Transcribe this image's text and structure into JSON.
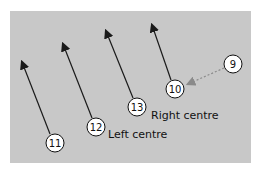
{
  "colors": {
    "field": "#c8c8c8",
    "arrow": "#1a1a1a",
    "pass_arrow": "#8a8a8a",
    "circle_fill": "#ffffff"
  },
  "players": [
    {
      "number": "9",
      "x": 233,
      "y": 64
    },
    {
      "number": "10",
      "x": 175,
      "y": 89
    },
    {
      "number": "11",
      "x": 55,
      "y": 143
    },
    {
      "number": "12",
      "x": 96,
      "y": 127
    },
    {
      "number": "13",
      "x": 137,
      "y": 107
    }
  ],
  "labels": {
    "left_centre": "Left centre",
    "right_centre": "Right centre"
  },
  "runs": [
    {
      "from": "11",
      "to_x": 22,
      "to_y": 60
    },
    {
      "from": "12",
      "to_x": 63,
      "to_y": 42
    },
    {
      "from": "13",
      "to_x": 106,
      "to_y": 29
    },
    {
      "from": "10",
      "to_x": 152,
      "to_y": 23
    }
  ],
  "pass": {
    "from": "9",
    "to": "10",
    "style": "dashed"
  }
}
